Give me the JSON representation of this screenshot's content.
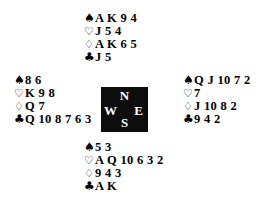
{
  "diagram": {
    "type": "bridge-hand-deal",
    "background_color": "#ffffff",
    "text_color": "#000000"
  },
  "suit_symbols": {
    "spade": "♠",
    "heart": "♡",
    "diamond": "♢",
    "club": "♣"
  },
  "compass": {
    "background_color": "#0d0d0d",
    "text_color": "#ffffff",
    "north": "N",
    "west": "W",
    "east": "E",
    "south": "S"
  },
  "hands": {
    "north": {
      "position_label": "North",
      "spades": "A K 9 4",
      "hearts": "J 5 4",
      "diamonds": "A K 6 5",
      "clubs": "J 5"
    },
    "west": {
      "position_label": "West",
      "spades": "8 6",
      "hearts": "K 9 8",
      "diamonds": "Q 7",
      "clubs": "Q 10 8 7 6 3"
    },
    "east": {
      "position_label": "East",
      "spades": "Q J 10 7 2",
      "hearts": "7",
      "diamonds": "J 10 8 2",
      "clubs": "9 4 2"
    },
    "south": {
      "position_label": "South",
      "spades": "5 3",
      "hearts": "A Q 10 6 3 2",
      "diamonds": "9 4 3",
      "clubs": "A K"
    }
  }
}
